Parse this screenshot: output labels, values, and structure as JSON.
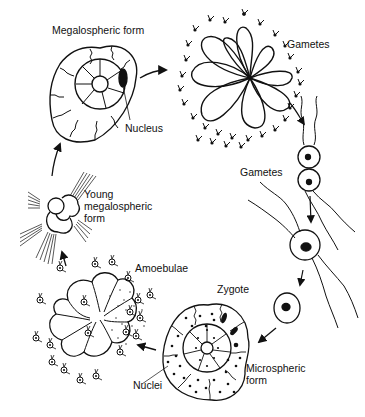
{
  "diagram": {
    "labels": {
      "megalospheric_form": "Megalospheric form",
      "nucleus": "Nucleus",
      "gametes_top": "Gametes",
      "gametes_mid": "Gametes",
      "zygote": "Zygote",
      "microspheric_form_line1": "Microspheric",
      "microspheric_form_line2": "form",
      "nuclei": "Nuclei",
      "amoebulae": "Amoebulae",
      "young_line1": "Young",
      "young_line2": "megalospheric",
      "young_line3": "form"
    },
    "stages": [
      "Megalospheric form",
      "Gametes released",
      "Gametes fuse",
      "Zygote",
      "Microspheric form",
      "Amoebulae",
      "Young megalospheric form"
    ],
    "colors": {
      "ink": "#111111",
      "background": "#ffffff"
    }
  }
}
